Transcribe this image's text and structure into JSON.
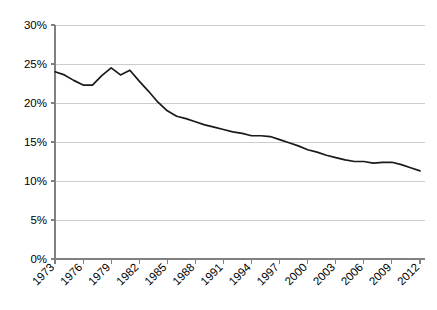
{
  "chart_data": {
    "type": "line",
    "title": "",
    "subtitle": "",
    "xlabel": "",
    "ylabel": "",
    "grid": "horizontal",
    "legend": "none",
    "xlim": [
      1973,
      2012
    ],
    "ylim": [
      0,
      30
    ],
    "ytick_values": [
      0,
      5,
      10,
      15,
      20,
      25,
      30
    ],
    "ytick_labels": [
      "0%",
      "5%",
      "10%",
      "15%",
      "20%",
      "25%",
      "30%"
    ],
    "xtick_values": [
      1973,
      1976,
      1979,
      1982,
      1985,
      1988,
      1991,
      1994,
      1997,
      2000,
      2003,
      2006,
      2009,
      2012
    ],
    "xtick_labels": [
      "1973",
      "1976",
      "1979",
      "1982",
      "1985",
      "1988",
      "1991",
      "1994",
      "1997",
      "2000",
      "2003",
      "2006",
      "2009",
      "2012"
    ],
    "x": [
      1973,
      1974,
      1975,
      1976,
      1977,
      1978,
      1979,
      1980,
      1981,
      1982,
      1983,
      1984,
      1985,
      1986,
      1987,
      1988,
      1989,
      1990,
      1991,
      1992,
      1993,
      1994,
      1995,
      1996,
      1997,
      1998,
      1999,
      2000,
      2001,
      2002,
      2003,
      2004,
      2005,
      2006,
      2007,
      2008,
      2009,
      2010,
      2011,
      2012
    ],
    "values": [
      24.0,
      23.6,
      22.9,
      22.3,
      22.3,
      23.5,
      24.5,
      23.6,
      24.2,
      22.8,
      21.5,
      20.1,
      19.0,
      18.3,
      18.0,
      17.6,
      17.2,
      16.9,
      16.6,
      16.3,
      16.1,
      15.8,
      15.8,
      15.7,
      15.3,
      14.9,
      14.5,
      14.0,
      13.7,
      13.3,
      13.0,
      12.7,
      12.5,
      12.5,
      12.3,
      12.4,
      12.4,
      12.1,
      11.7,
      11.3
    ],
    "series": [
      {
        "name": "series-1",
        "color": "#1a1a1a",
        "values": [
          24.0,
          23.6,
          22.9,
          22.3,
          22.3,
          23.5,
          24.5,
          23.6,
          24.2,
          22.8,
          21.5,
          20.1,
          19.0,
          18.3,
          18.0,
          17.6,
          17.2,
          16.9,
          16.6,
          16.3,
          16.1,
          15.8,
          15.8,
          15.7,
          15.3,
          14.9,
          14.5,
          14.0,
          13.7,
          13.3,
          13.0,
          12.7,
          12.5,
          12.5,
          12.3,
          12.4,
          12.4,
          12.1,
          11.7,
          11.3
        ]
      }
    ],
    "colors": {
      "line": "#1a1a1a",
      "grid": "#bfbfbf",
      "axis": "#808080",
      "background": "#ffffff",
      "text": "#000000"
    }
  }
}
